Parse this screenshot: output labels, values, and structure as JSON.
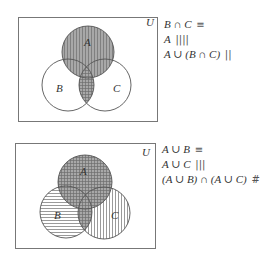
{
  "diagrams": [
    {
      "universe_label": "U",
      "sets": [
        {
          "label": "A"
        },
        {
          "label": "B"
        },
        {
          "label": "C"
        }
      ],
      "legend": [
        {
          "expr": "B ∩ C",
          "pattern": "horizontal-lines",
          "glyph": "≡"
        },
        {
          "expr": "A",
          "pattern": "vertical-lines",
          "glyph": "||||"
        },
        {
          "expr": "A ∪ (B ∩ C)",
          "pattern": "shaded",
          "glyph": "||"
        }
      ]
    },
    {
      "universe_label": "U",
      "sets": [
        {
          "label": "A"
        },
        {
          "label": "B"
        },
        {
          "label": "C"
        }
      ],
      "legend": [
        {
          "expr": "A ∪ B",
          "pattern": "horizontal-lines",
          "glyph": "≡"
        },
        {
          "expr": "A ∪ C",
          "pattern": "vertical-lines",
          "glyph": "|||"
        },
        {
          "expr": "(A ∪ B) ∩ (A ∪ C)",
          "pattern": "cross-hatch-shaded",
          "glyph": "#"
        }
      ]
    }
  ],
  "colors": {
    "shade": "#a8a8a8",
    "hatch": "#6e6e6e",
    "outline": "#555555",
    "box": "#777777"
  }
}
